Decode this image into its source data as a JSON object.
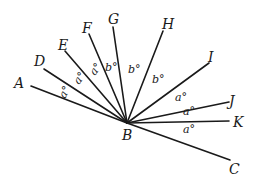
{
  "diagram": {
    "type": "geometry-angles",
    "vertex": {
      "label": "B",
      "x": 127,
      "y": 123,
      "label_x": 122,
      "label_y": 140
    },
    "rays": [
      {
        "name": "A",
        "end_x": 31,
        "end_y": 86,
        "label_x": 14,
        "label_y": 88
      },
      {
        "name": "D",
        "end_x": 44,
        "end_y": 69,
        "label_x": 34,
        "label_y": 66
      },
      {
        "name": "E",
        "end_x": 65,
        "end_y": 51,
        "label_x": 58,
        "label_y": 50
      },
      {
        "name": "F",
        "end_x": 89,
        "end_y": 34,
        "label_x": 82,
        "label_y": 33
      },
      {
        "name": "G",
        "end_x": 113,
        "end_y": 27,
        "label_x": 108,
        "label_y": 24
      },
      {
        "name": "H",
        "end_x": 163,
        "end_y": 31,
        "label_x": 162,
        "label_y": 29
      },
      {
        "name": "I",
        "end_x": 209,
        "end_y": 63,
        "label_x": 208,
        "label_y": 62
      },
      {
        "name": "J",
        "end_x": 229,
        "end_y": 102,
        "label_x": 229,
        "label_y": 106
      },
      {
        "name": "K",
        "end_x": 229,
        "end_y": 121,
        "label_x": 233,
        "label_y": 127
      },
      {
        "name": "C",
        "end_x": 230,
        "end_y": 160,
        "label_x": 229,
        "label_y": 174
      }
    ],
    "angle_labels": [
      {
        "between": "A-D",
        "text": "a°",
        "x": 65,
        "y": 99,
        "rotate": -62
      },
      {
        "between": "D-E",
        "text": "a°",
        "x": 79,
        "y": 85,
        "rotate": -55
      },
      {
        "between": "E-F",
        "text": "a°",
        "x": 95,
        "y": 76,
        "rotate": -55
      },
      {
        "between": "F-G",
        "text": "b°",
        "x": 105,
        "y": 71,
        "rotate": 0
      },
      {
        "between": "G-H",
        "text": "b°",
        "x": 128,
        "y": 73,
        "rotate": 0
      },
      {
        "between": "H-I",
        "text": "b°",
        "x": 152,
        "y": 83,
        "rotate": 0
      },
      {
        "between": "I-J",
        "text": "a°",
        "x": 175,
        "y": 101,
        "rotate": 0
      },
      {
        "between": "J-K",
        "text": "a°",
        "x": 183,
        "y": 115,
        "rotate": 0
      },
      {
        "between": "K-C",
        "text": "a°",
        "x": 183,
        "y": 133,
        "rotate": 0
      }
    ]
  }
}
